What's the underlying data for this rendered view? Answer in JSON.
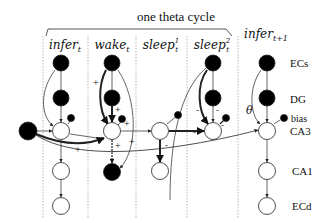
{
  "header": {
    "brace_label": "one theta cycle"
  },
  "columns": [
    {
      "id": "infer_t",
      "base": "infer",
      "sub": "t",
      "sup": ""
    },
    {
      "id": "wake_t",
      "base": "wake",
      "sub": "t",
      "sup": ""
    },
    {
      "id": "sleep1_t",
      "base": "sleep",
      "sub": "t",
      "sup": "1"
    },
    {
      "id": "sleep2_t",
      "base": "sleep",
      "sub": "t",
      "sup": "2"
    },
    {
      "id": "infer_t1",
      "base": "infer",
      "sub": "t+1",
      "sup": ""
    }
  ],
  "rows": {
    "ecs": "ECs",
    "dg": "DG",
    "bias": "bias",
    "ca3": "CA3",
    "ca1": "CA1",
    "ecd": "ECd"
  },
  "annotations": {
    "theta": "θ",
    "plus": "+",
    "minus": "-"
  },
  "colors": {
    "filled_node": "#000000",
    "empty_node": "#ffffff",
    "stroke": "#222222",
    "separator": "#999999"
  }
}
